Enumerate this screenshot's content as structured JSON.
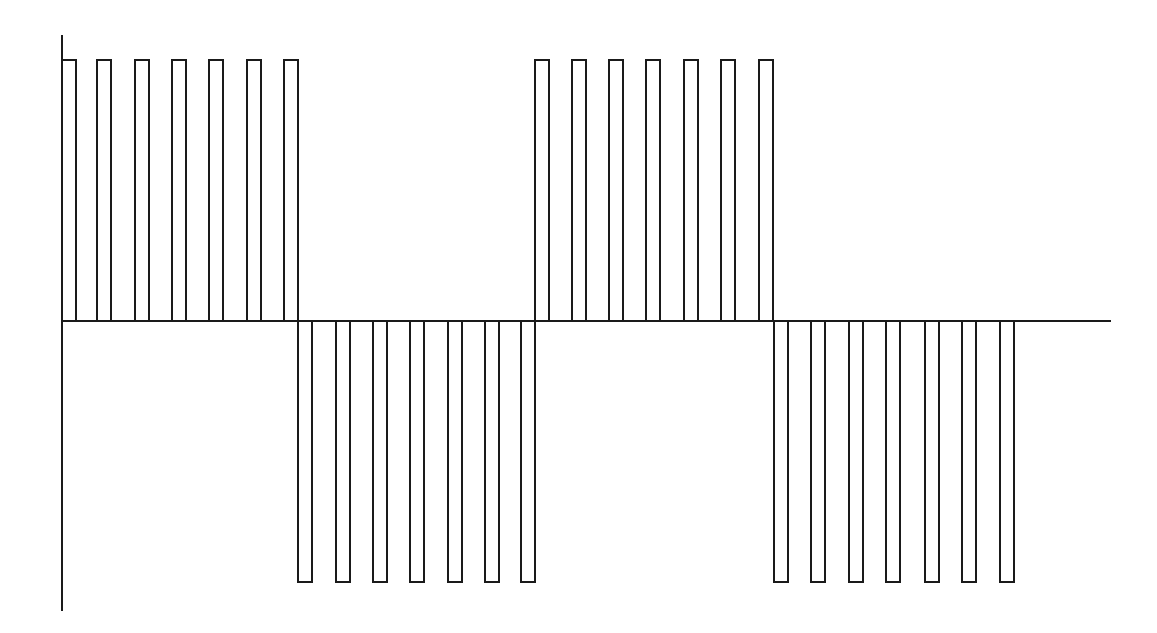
{
  "diagram": {
    "title": "",
    "stroke_color": "#1a1a1a",
    "background_color": "#ffffff",
    "axes": {
      "y_axis": {
        "x": 62,
        "y_top": 35,
        "y_bottom": 611
      },
      "x_axis": {
        "y": 321,
        "x_start": 62,
        "x_end": 1111
      }
    },
    "levels": {
      "positive_top": 60,
      "baseline": 321,
      "negative_bottom": 582
    },
    "pulse_width": 14,
    "groups": [
      {
        "polarity": "positive",
        "starts": [
          62,
          97,
          135,
          172,
          209,
          247,
          284
        ]
      },
      {
        "polarity": "negative",
        "starts": [
          298,
          336,
          373,
          410,
          448,
          485,
          521
        ]
      },
      {
        "polarity": "positive",
        "starts": [
          535,
          572,
          609,
          646,
          684,
          721,
          759
        ]
      },
      {
        "polarity": "negative",
        "starts": [
          774,
          811,
          849,
          886,
          925,
          962,
          1000
        ]
      }
    ]
  }
}
